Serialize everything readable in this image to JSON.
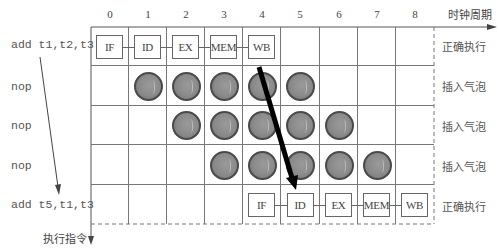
{
  "axis": {
    "time_label": "时钟周期",
    "exec_label": "执行指令",
    "columns": [
      "0",
      "1",
      "2",
      "3",
      "4",
      "5",
      "6",
      "7",
      "8"
    ]
  },
  "rows": [
    {
      "instruction": "add t1,t2,t3",
      "status": "正确执行",
      "stages": [
        {
          "col": 0,
          "label": "IF"
        },
        {
          "col": 1,
          "label": "ID"
        },
        {
          "col": 2,
          "label": "EX"
        },
        {
          "col": 3,
          "label": "MEM"
        },
        {
          "col": 4,
          "label": "WB"
        }
      ],
      "bubbles": []
    },
    {
      "instruction": "nop",
      "status": "插入气泡",
      "stages": [],
      "bubbles": [
        1,
        2,
        3,
        4,
        5
      ]
    },
    {
      "instruction": "nop",
      "status": "插入气泡",
      "stages": [],
      "bubbles": [
        2,
        3,
        4,
        5,
        6
      ]
    },
    {
      "instruction": "nop",
      "status": "插入气泡",
      "stages": [],
      "bubbles": [
        3,
        4,
        5,
        6,
        7
      ]
    },
    {
      "instruction": "add t5,t1,t3",
      "status": "正确执行",
      "stages": [
        {
          "col": 4,
          "label": "IF"
        },
        {
          "col": 5,
          "label": "ID"
        },
        {
          "col": 6,
          "label": "EX"
        },
        {
          "col": 7,
          "label": "MEM"
        },
        {
          "col": 8,
          "label": "WB"
        }
      ],
      "bubbles": []
    }
  ],
  "forwarding_arrow": {
    "from": "WB (row 0, col 4)",
    "to": "ID (row 4, col 5)"
  },
  "colors": {
    "grid": "#777777",
    "bubble": "#8a8a8a",
    "arrow": "#000000"
  }
}
